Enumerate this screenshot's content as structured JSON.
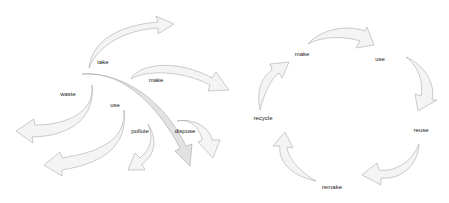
{
  "diagram": {
    "linear": {
      "labels": [
        {
          "id": "take",
          "text": "take"
        },
        {
          "id": "make",
          "text": "make"
        },
        {
          "id": "waste",
          "text": "waste"
        },
        {
          "id": "use",
          "text": "use"
        },
        {
          "id": "pollute",
          "text": "pollute"
        },
        {
          "id": "dispose",
          "text": "dispose"
        }
      ]
    },
    "circular": {
      "labels": [
        {
          "id": "make",
          "text": "make"
        },
        {
          "id": "use",
          "text": "use"
        },
        {
          "id": "reuse",
          "text": "reuse"
        },
        {
          "id": "remake",
          "text": "remake"
        },
        {
          "id": "recycle",
          "text": "recycle"
        }
      ]
    },
    "colors": {
      "arrow_fill": "#f4f4f4",
      "arrow_stroke": "#9a9a9a",
      "text": "#222222"
    }
  }
}
